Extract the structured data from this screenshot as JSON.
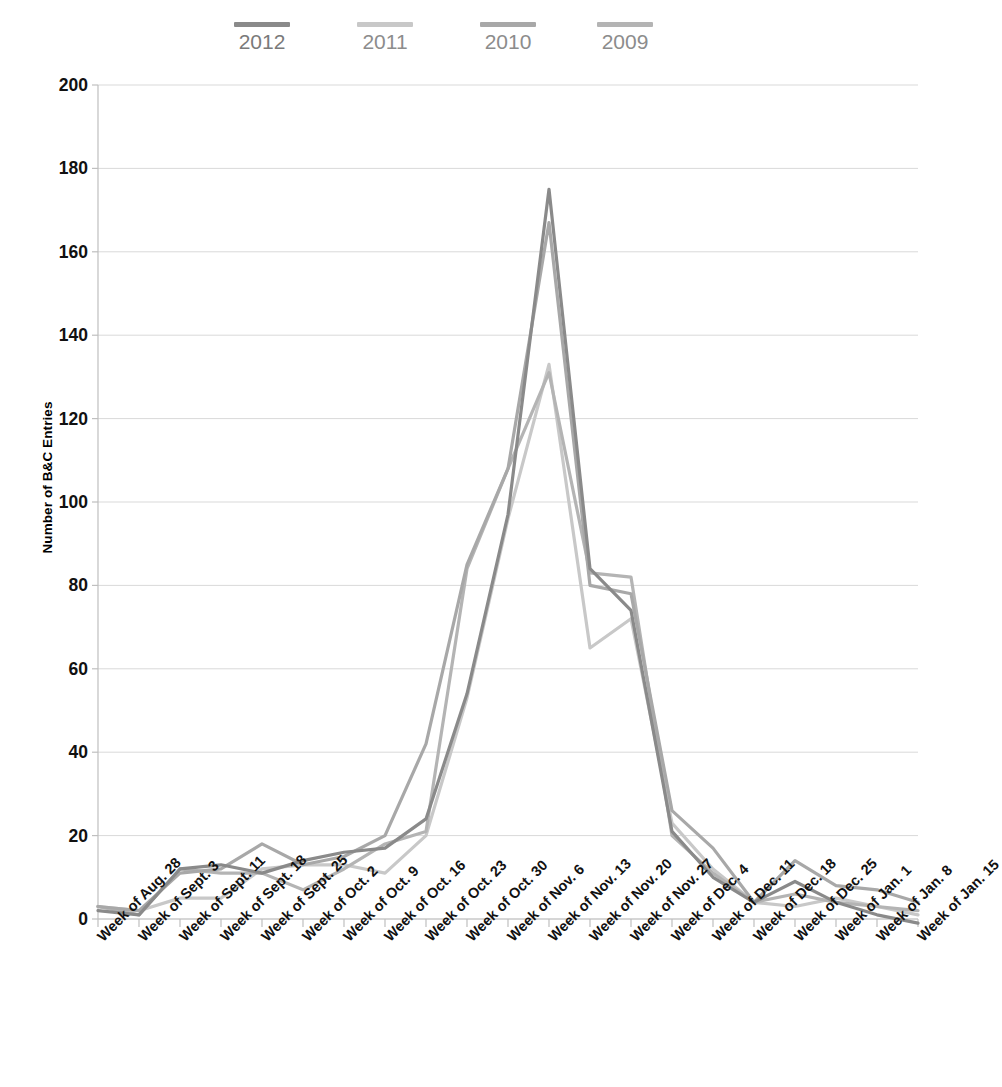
{
  "chart_data": {
    "type": "line",
    "title": "",
    "xlabel": "",
    "ylabel": "Number of B&C Entries",
    "ylim": [
      0,
      200
    ],
    "yticks": [
      0,
      20,
      40,
      60,
      80,
      100,
      120,
      140,
      160,
      180,
      200
    ],
    "grid": true,
    "legend_position": "top",
    "categories": [
      "Week of Aug. 28",
      "Week of Sept. 3",
      "Week of Sept. 11",
      "Week of Sept. 18",
      "Week of Sept. 25",
      "Week of Oct. 2",
      "Week of Oct. 9",
      "Week of Oct. 16",
      "Week of Oct. 23",
      "Week of Oct. 30",
      "Week of Nov. 6",
      "Week of Nov. 13",
      "Week of Nov. 20",
      "Week of Nov. 27",
      "Week of Dec. 4",
      "Week of Dec. 11",
      "Week of Dec. 18",
      "Week of Dec. 25",
      "Week of Jan. 1",
      "Week of Jan. 8",
      "Week of Jan. 15"
    ],
    "series": [
      {
        "name": "2012",
        "color": "#8a8a8a",
        "values": [
          2,
          1,
          12,
          13,
          11,
          14,
          16,
          17,
          24,
          54,
          97,
          175,
          84,
          74,
          21,
          10,
          4,
          9,
          4,
          1,
          -1
        ]
      },
      {
        "name": "2011",
        "color": "#c8c8c8",
        "values": [
          3,
          2,
          5,
          5,
          12,
          13,
          13,
          11,
          20,
          53,
          96,
          133,
          65,
          72,
          23,
          12,
          4,
          3,
          5,
          3,
          1
        ]
      },
      {
        "name": "2010",
        "color": "#a8a8a8",
        "values": [
          3,
          2,
          11,
          12,
          18,
          13,
          15,
          20,
          42,
          85,
          108,
          167,
          80,
          78,
          26,
          17,
          4,
          14,
          8,
          7,
          4
        ]
      },
      {
        "name": "2009",
        "color": "#b4b4b4",
        "values": [
          3,
          1,
          12,
          11,
          11,
          7,
          12,
          18,
          21,
          84,
          108,
          131,
          83,
          82,
          20,
          11,
          4,
          6,
          4,
          3,
          2
        ]
      }
    ]
  },
  "legend": {
    "items": [
      {
        "label": "2012",
        "color": "#8a8a8a"
      },
      {
        "label": "2011",
        "color": "#c8c8c8"
      },
      {
        "label": "2010",
        "color": "#a8a8a8"
      },
      {
        "label": "2009",
        "color": "#b4b4b4"
      }
    ]
  },
  "axes": {
    "y_title": "Number of B&C Entries"
  },
  "colors": {
    "grid": "#d9d9d9",
    "axis": "#bfbfbf",
    "text": "#111111",
    "legend_text": "#8c8c8c"
  }
}
